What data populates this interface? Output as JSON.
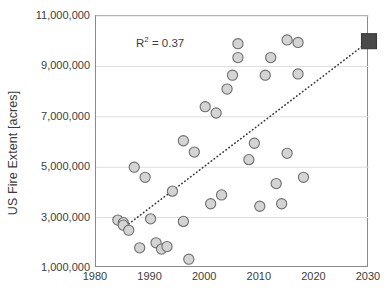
{
  "chart_data": {
    "type": "scatter",
    "title": "",
    "xlabel": "",
    "ylabel": "US Fire Extent [acres]",
    "xlim": [
      1980,
      2030
    ],
    "ylim": [
      1000000,
      11000000
    ],
    "xticks": [
      1980,
      1990,
      2000,
      2010,
      2020,
      2030
    ],
    "xtick_labels": [
      "1980",
      "1990",
      "2000",
      "2010",
      "2020",
      "2030"
    ],
    "yticks": [
      1000000,
      3000000,
      5000000,
      7000000,
      9000000,
      11000000
    ],
    "ytick_labels": [
      "1,000,000",
      "3,000,000",
      "5,000,000",
      "7,000,000",
      "9,000,000",
      "11,000,000"
    ],
    "grid": "horizontal",
    "legend": "none",
    "annotations": [
      {
        "text": "R² = 0.37",
        "x": 1987.5,
        "y": 10200000
      }
    ],
    "series": [
      {
        "name": "US Fire Extent",
        "marker": "circle",
        "marker_fill": "#d4d4d4",
        "marker_edge": "#6e6e6e",
        "points": [
          {
            "x": 1984,
            "y": 2900000
          },
          {
            "x": 1985,
            "y": 2800000
          },
          {
            "x": 1985,
            "y": 2700000
          },
          {
            "x": 1986,
            "y": 2500000
          },
          {
            "x": 1987,
            "y": 5000000
          },
          {
            "x": 1988,
            "y": 1800000
          },
          {
            "x": 1989,
            "y": 4600000
          },
          {
            "x": 1990,
            "y": 2950000
          },
          {
            "x": 1991,
            "y": 2000000
          },
          {
            "x": 1992,
            "y": 1750000
          },
          {
            "x": 1993,
            "y": 1850000
          },
          {
            "x": 1994,
            "y": 4050000
          },
          {
            "x": 1996,
            "y": 6050000
          },
          {
            "x": 1996,
            "y": 2850000
          },
          {
            "x": 1997,
            "y": 1350000
          },
          {
            "x": 1998,
            "y": 5600000
          },
          {
            "x": 2000,
            "y": 7400000
          },
          {
            "x": 2001,
            "y": 3550000
          },
          {
            "x": 2002,
            "y": 7150000
          },
          {
            "x": 2003,
            "y": 3900000
          },
          {
            "x": 2004,
            "y": 8100000
          },
          {
            "x": 2005,
            "y": 8650000
          },
          {
            "x": 2006,
            "y": 9900000
          },
          {
            "x": 2006,
            "y": 9350000
          },
          {
            "x": 2008,
            "y": 5300000
          },
          {
            "x": 2009,
            "y": 5950000
          },
          {
            "x": 2010,
            "y": 3450000
          },
          {
            "x": 2011,
            "y": 8650000
          },
          {
            "x": 2012,
            "y": 9350000
          },
          {
            "x": 2013,
            "y": 4350000
          },
          {
            "x": 2014,
            "y": 3550000
          },
          {
            "x": 2015,
            "y": 10050000
          },
          {
            "x": 2015,
            "y": 5550000
          },
          {
            "x": 2017,
            "y": 9950000
          },
          {
            "x": 2017,
            "y": 8700000
          },
          {
            "x": 2018,
            "y": 4600000
          }
        ]
      },
      {
        "name": "Projection marker",
        "marker": "square",
        "marker_fill": "#4a4a4a",
        "marker_edge": "#3a3a3a",
        "points": [
          {
            "x": 2030,
            "y": 10000000
          }
        ]
      }
    ],
    "trendline": {
      "style": "dotted",
      "color": "#3a3a3a",
      "r_squared": 0.37,
      "x_start": 1986,
      "y_start": 2750000,
      "x_end": 2030,
      "y_end": 10000000
    }
  }
}
